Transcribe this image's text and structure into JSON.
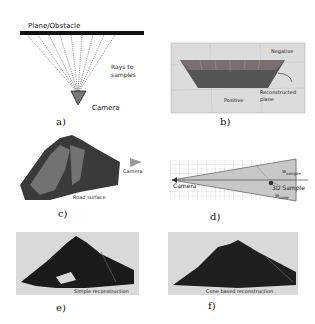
{
  "figure": {
    "panels": [
      {
        "id": "a",
        "label": "a)",
        "annotations": {
          "plane": "Plane/Obstacle",
          "rays_line1": "Rays to",
          "rays_line2": "samples",
          "camera": "Camera"
        }
      },
      {
        "id": "b",
        "label": "b)",
        "annotations": {
          "negative": "Negative",
          "positive": "Positive",
          "reconstructed_line1": "Reconstructed",
          "reconstructed_line2": "plane"
        }
      },
      {
        "id": "c",
        "label": "c)",
        "annotations": {
          "camera": "Camera",
          "road": "Road surface"
        }
      },
      {
        "id": "d",
        "label": "d)",
        "annotations": {
          "camera": "Camera",
          "sample": "3D Sample",
          "w_sample": "w",
          "w_sample_sub": "sample",
          "w_cone": "w",
          "w_cone_sub": "cone"
        }
      },
      {
        "id": "e",
        "label": "e)",
        "annotations": {
          "caption": "Simple reconstruction"
        }
      },
      {
        "id": "f",
        "label": "f)",
        "annotations": {
          "caption": "Cone based reconstruction"
        }
      }
    ],
    "colors": {
      "background": "#ffffff",
      "panel_gray": "#d9d9d9",
      "mesh_dark": "#2a2a2a",
      "cone_fill": "#c8c8c8"
    }
  }
}
